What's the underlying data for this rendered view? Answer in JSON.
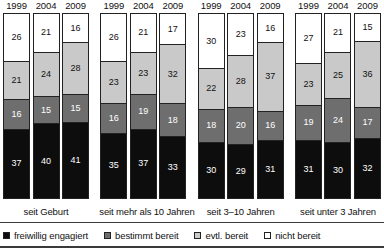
{
  "chart_data": {
    "type": "bar",
    "subtype": "stacked-100-percent-vertical",
    "title": "",
    "subtitle": "",
    "xlabel": "",
    "ylabel": "",
    "ylim": [
      0,
      100
    ],
    "grid": false,
    "legend_position": "bottom",
    "unit": "%",
    "categories": [
      "seit Geburt",
      "seit mehr als 10 Jahren",
      "seit 3–10 Jahren",
      "seit unter 3 Jahren"
    ],
    "subcategories": [
      "1999",
      "2004",
      "2009"
    ],
    "series": [
      {
        "name": "freiwillig engagiert",
        "color": "#0d0d0d",
        "values": [
          [
            37,
            40,
            41
          ],
          [
            35,
            37,
            33
          ],
          [
            30,
            29,
            31
          ],
          [
            31,
            30,
            32
          ]
        ]
      },
      {
        "name": "bestimmt bereit",
        "color": "#6e6e6e",
        "values": [
          [
            16,
            15,
            15
          ],
          [
            16,
            19,
            18
          ],
          [
            18,
            20,
            16
          ],
          [
            19,
            24,
            17
          ]
        ]
      },
      {
        "name": "evtl. bereit",
        "color": "#c9c9c9",
        "values": [
          [
            21,
            24,
            28
          ],
          [
            23,
            23,
            32
          ],
          [
            22,
            28,
            37
          ],
          [
            23,
            25,
            36
          ]
        ]
      },
      {
        "name": "nicht bereit",
        "color": "#ffffff",
        "values": [
          [
            26,
            21,
            16
          ],
          [
            26,
            21,
            17
          ],
          [
            30,
            23,
            16
          ],
          [
            27,
            21,
            15
          ]
        ]
      }
    ]
  },
  "groups": [
    {
      "category": "seit Geburt",
      "bars": [
        {
          "year": "1999",
          "nicht_bereit": 26,
          "evtl_bereit": 21,
          "bestimmt_bereit": 16,
          "freiwillig_engagiert": 37
        },
        {
          "year": "2004",
          "nicht_bereit": 21,
          "evtl_bereit": 24,
          "bestimmt_bereit": 15,
          "freiwillig_engagiert": 40
        },
        {
          "year": "2009",
          "nicht_bereit": 16,
          "evtl_bereit": 28,
          "bestimmt_bereit": 15,
          "freiwillig_engagiert": 41
        }
      ]
    },
    {
      "category": "seit mehr als 10 Jahren",
      "bars": [
        {
          "year": "1999",
          "nicht_bereit": 26,
          "evtl_bereit": 23,
          "bestimmt_bereit": 16,
          "freiwillig_engagiert": 35
        },
        {
          "year": "2004",
          "nicht_bereit": 21,
          "evtl_bereit": 23,
          "bestimmt_bereit": 19,
          "freiwillig_engagiert": 37
        },
        {
          "year": "2009",
          "nicht_bereit": 17,
          "evtl_bereit": 32,
          "bestimmt_bereit": 18,
          "freiwillig_engagiert": 33
        }
      ]
    },
    {
      "category": "seit 3–10 Jahren",
      "bars": [
        {
          "year": "1999",
          "nicht_bereit": 30,
          "evtl_bereit": 22,
          "bestimmt_bereit": 18,
          "freiwillig_engagiert": 30
        },
        {
          "year": "2004",
          "nicht_bereit": 23,
          "evtl_bereit": 28,
          "bestimmt_bereit": 20,
          "freiwillig_engagiert": 29
        },
        {
          "year": "2009",
          "nicht_bereit": 16,
          "evtl_bereit": 37,
          "bestimmt_bereit": 16,
          "freiwillig_engagiert": 31
        }
      ]
    },
    {
      "category": "seit unter 3 Jahren",
      "bars": [
        {
          "year": "1999",
          "nicht_bereit": 27,
          "evtl_bereit": 23,
          "bestimmt_bereit": 19,
          "freiwillig_engagiert": 31
        },
        {
          "year": "2004",
          "nicht_bereit": 21,
          "evtl_bereit": 25,
          "bestimmt_bereit": 24,
          "freiwillig_engagiert": 30
        },
        {
          "year": "2009",
          "nicht_bereit": 15,
          "evtl_bereit": 36,
          "bestimmt_bereit": 17,
          "freiwillig_engagiert": 32
        }
      ]
    }
  ],
  "legend": {
    "items": [
      {
        "label": "freiwillig engagiert",
        "color": "#0d0d0d",
        "swatch_class": "sw-freiwillig"
      },
      {
        "label": "bestimmt bereit",
        "color": "#6e6e6e",
        "swatch_class": "sw-bestimmt"
      },
      {
        "label": "evtl. bereit",
        "color": "#c9c9c9",
        "swatch_class": "sw-evtl"
      },
      {
        "label": "nicht bereit",
        "color": "#ffffff",
        "swatch_class": "sw-nicht"
      }
    ]
  }
}
